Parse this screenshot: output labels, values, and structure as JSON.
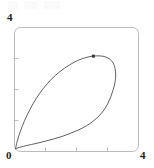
{
  "figure": {
    "kind": "parametric-plot",
    "background_color": "#ffffff",
    "frame": {
      "visible": true,
      "color": "#b9bbbd",
      "corner_radius": 6,
      "x_px": 14,
      "y_px": 27,
      "width_px": 124,
      "height_px": 124
    }
  },
  "labels": {
    "y_max": "4",
    "origin": "0",
    "x_max": "4"
  },
  "chart_data": {
    "type": "line",
    "title": "",
    "xlabel": "",
    "ylabel": "",
    "xlim": [
      0,
      4
    ],
    "ylim": [
      0,
      4
    ],
    "grid": false,
    "legend": false,
    "legend_position": "none",
    "x_ticks": [
      0,
      1,
      2,
      3,
      4
    ],
    "x_tick_labels": [
      "0",
      "",
      "",
      "",
      "4"
    ],
    "y_ticks": [
      0,
      1,
      2,
      3,
      4
    ],
    "y_tick_labels": [
      "0",
      "",
      "",
      "",
      "4"
    ],
    "line_color": "#4d4d4d",
    "line_width": 0.9,
    "series": [
      {
        "name": "closed-loop-curve",
        "closed": true,
        "x": [
          0.05,
          0.1,
          0.2,
          0.34,
          0.52,
          0.72,
          0.95,
          1.2,
          1.48,
          1.78,
          2.08,
          2.38,
          2.66,
          2.9,
          3.08,
          3.2,
          3.26,
          3.28,
          3.26,
          3.2,
          3.12,
          3.02,
          2.9,
          2.74,
          2.55,
          2.33,
          2.08,
          1.82,
          1.55,
          1.28,
          1.02,
          0.78,
          0.56,
          0.38,
          0.23,
          0.13,
          0.07,
          0.04,
          0.05
        ],
        "y": [
          0.08,
          0.3,
          0.62,
          0.98,
          1.35,
          1.7,
          2.02,
          2.31,
          2.56,
          2.77,
          2.93,
          3.03,
          3.07,
          3.05,
          2.97,
          2.84,
          2.66,
          2.45,
          2.22,
          1.98,
          1.74,
          1.52,
          1.32,
          1.13,
          0.96,
          0.81,
          0.68,
          0.57,
          0.47,
          0.39,
          0.32,
          0.26,
          0.21,
          0.17,
          0.13,
          0.1,
          0.08,
          0.07,
          0.08
        ]
      }
    ],
    "markers": [
      {
        "name": "highlight-point",
        "x": 2.56,
        "y": 3.06,
        "color": "#3a3a3a",
        "size_px": 3,
        "shape": "square-dot"
      }
    ]
  }
}
